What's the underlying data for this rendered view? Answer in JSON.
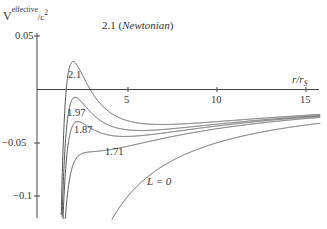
{
  "chart_data": {
    "type": "line",
    "title": "",
    "annotation_top": "2.1 (Newtonian)",
    "annotation_top_number": "2.1",
    "annotation_top_text": "Newtonian",
    "xlabel": "r/r_S",
    "xlabel_main": "r/r",
    "xlabel_sub": "S",
    "ylabel": "V^effective/c^2",
    "ylabel_main": "V",
    "ylabel_sup": "effective",
    "ylabel_tail": "/c",
    "ylabel_tail_sup": "2",
    "xlim": [
      0,
      15.8
    ],
    "ylim": [
      -0.12,
      0.055
    ],
    "x_ticks": [
      5,
      10,
      15
    ],
    "x_tick_labels": [
      "5",
      "10",
      "15"
    ],
    "y_ticks": [
      0.05,
      -0.05,
      -0.1
    ],
    "y_tick_labels": [
      "0.05",
      "−0.05",
      "−0.1"
    ],
    "grid": false,
    "legend": "none (inline curve labels)",
    "series": [
      {
        "name": "2.1",
        "L": 2.1,
        "label": "2.1",
        "peak": {
          "x": 1.6,
          "y": 0.026
        }
      },
      {
        "name": "1.97",
        "L": 1.97,
        "label": "1.97",
        "peak": {
          "x": 1.8,
          "y": -0.013
        }
      },
      {
        "name": "1.87",
        "L": 1.87,
        "label": "1.87",
        "peak": {
          "x": 1.9,
          "y": -0.038
        }
      },
      {
        "name": "1.71",
        "L": 1.71,
        "label": "1.71"
      },
      {
        "name": "L=0",
        "L": 0,
        "label": "L = 0"
      }
    ],
    "formula": "V/c^2 = -1/(2x) + L^2/(2x^2) - L^2/(2x^3), x = r/r_S"
  }
}
